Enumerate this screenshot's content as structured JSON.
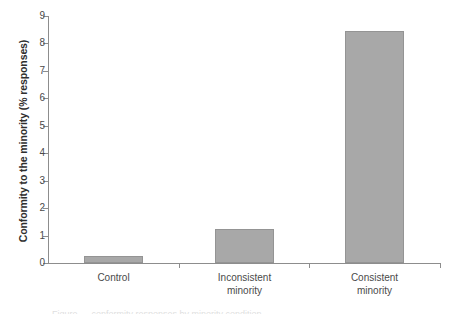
{
  "chart_data": {
    "type": "bar",
    "title": "",
    "subtitle": "",
    "xlabel": "",
    "ylabel": "Conformity to the minority (% responses)",
    "categories": [
      "Control",
      "Inconsistent minority",
      "Consistent minority"
    ],
    "category_lines": [
      [
        "Control"
      ],
      [
        "Inconsistent",
        "minority"
      ],
      [
        "Consistent",
        "minority"
      ]
    ],
    "values": [
      0.25,
      1.25,
      8.45
    ],
    "ylim": [
      0,
      9
    ],
    "ytick_values": [
      0,
      1,
      2,
      3,
      4,
      5,
      6,
      7,
      8,
      9
    ],
    "ytick_labels": [
      "0",
      "1",
      "2",
      "3",
      "4",
      "5",
      "6",
      "7",
      "8",
      "9"
    ],
    "grid": false,
    "legend": false,
    "legend_position": "none",
    "bar_color": "#a8a8a8",
    "bar_edge_color": "#949494",
    "axis_color": "#8d8d8d"
  },
  "figure": {
    "caption_fragment": "Figure — conformity responses by minority condition"
  }
}
